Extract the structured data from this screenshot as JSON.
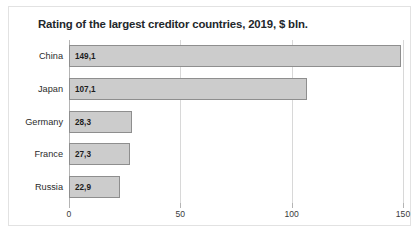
{
  "chart_data": {
    "type": "bar",
    "orientation": "horizontal",
    "title": "Rating of the largest creditor countries, 2019, $ bln.",
    "categories": [
      "China",
      "Japan",
      "Germany",
      "France",
      "Russia"
    ],
    "values": [
      149.1,
      107.1,
      28.3,
      27.3,
      22.9
    ],
    "value_labels": [
      "149,1",
      "107,1",
      "28,3",
      "27,3",
      "22,9"
    ],
    "xlabel": "",
    "ylabel": "",
    "xlim": [
      0,
      150
    ],
    "xticks": [
      0,
      50,
      100,
      150
    ],
    "xtick_labels": [
      "0",
      "50",
      "100",
      "150"
    ],
    "grid": true,
    "legend": false,
    "colors": {
      "bar_fill": "#cccccc",
      "bar_border": "#8e8e8e",
      "gridline": "#d8d8d8",
      "axis": "#b4b4b4",
      "title_text": "#23272b",
      "panel_bg": "#ffffff",
      "panel_border": "#e2e2e2"
    }
  }
}
